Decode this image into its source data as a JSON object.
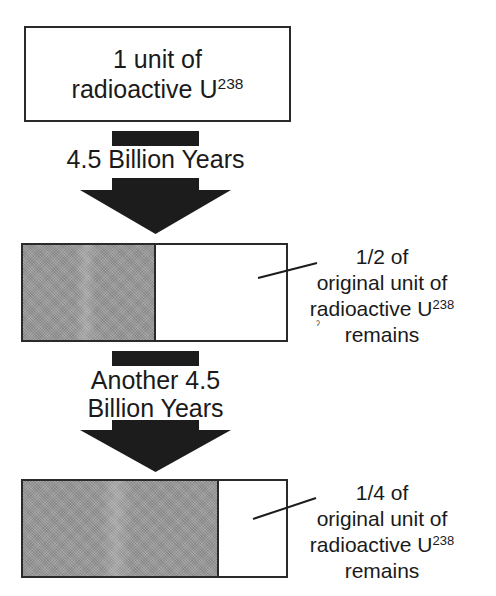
{
  "diagram": {
    "start": {
      "line1": "1 unit of",
      "line2_prefix": "radioactive U",
      "line2_sup": "238"
    },
    "steps": [
      {
        "time_label_lines": [
          "4.5 Billion Years"
        ],
        "remaining_fraction": 0.5,
        "shaded_fraction": 0.5,
        "label": {
          "line1": "1/2 of",
          "line2": "original unit of",
          "line3_prefix": "radioactive U",
          "line3_sup": "238",
          "line4": "remains"
        }
      },
      {
        "time_label_lines": [
          "Another 4.5",
          "Billion Years"
        ],
        "remaining_fraction": 0.25,
        "shaded_fraction": 0.75,
        "label": {
          "line1": "1/4 of",
          "line2": "original unit of",
          "line3_prefix": "radioactive U",
          "line3_sup": "238",
          "line4": "remains"
        }
      }
    ],
    "colors": {
      "ink": "#1c1c1c",
      "shade": "#9c9c9c",
      "background": "#ffffff"
    }
  }
}
